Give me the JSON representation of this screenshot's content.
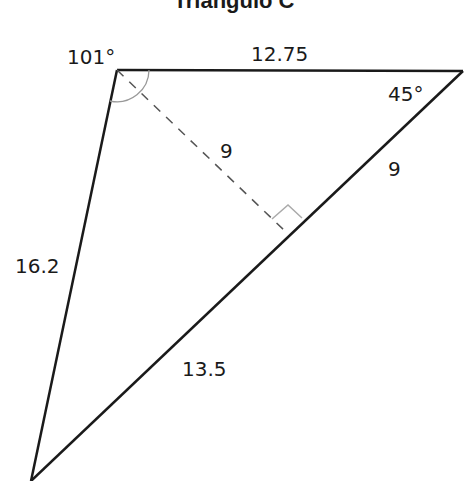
{
  "title": "Triangulo C",
  "vertices": {
    "top_left": {
      "x": 117,
      "y": 70
    },
    "top_right": {
      "x": 463,
      "y": 71
    },
    "bottom": {
      "x": 31,
      "y": 481
    }
  },
  "altitude_foot": {
    "x": 286,
    "y": 232
  },
  "labels": {
    "angle_top_left": "101°",
    "angle_top_right": "45°",
    "side_top": "12.75",
    "side_left": "16.2",
    "side_right_upper": "9",
    "side_right_lower": "13.5",
    "altitude": "9"
  },
  "colors": {
    "line": "#1a1a1a",
    "dashed": "#555555",
    "arc": "#999999",
    "right_angle": "#aaaaaa"
  }
}
